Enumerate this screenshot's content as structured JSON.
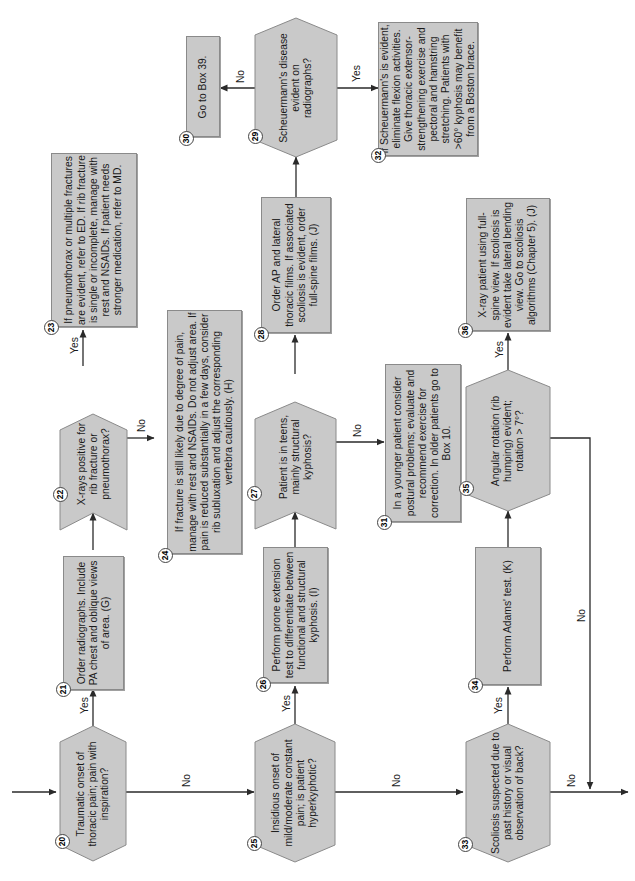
{
  "flowchart": {
    "orientation": "rotated-90-ccw",
    "colors": {
      "box_fill": "#c9c9c9",
      "box_border": "#8a8a8a",
      "line": "#333333"
    },
    "nodes": {
      "n20": {
        "number": "20",
        "type": "decision",
        "text": "Traumatic onset of thoracic pain; pain with inspiration?"
      },
      "n21": {
        "number": "21",
        "type": "process",
        "text": "Order radiographs. Include PA chest and oblique views of area. (G)"
      },
      "n22": {
        "number": "22",
        "type": "decision",
        "text": "X-rays positive for rib fracture or pneumothorax?"
      },
      "n23": {
        "number": "23",
        "type": "process",
        "text": "If pneumothorax or multiple fractures are evident, refer to ED. If rib fracture is single or incomplete, manage with rest and NSAIDs. If patient needs stronger medication, refer to MD."
      },
      "n24": {
        "number": "24",
        "type": "process",
        "text": "If fracture is still likely due to degree of pain, manage with rest and NSAIDs. Do not adjust area. If pain is reduced substantially in a few days, consider rib subluxation and adjust the corresponding vertebra cautiously. (H)"
      },
      "n25": {
        "number": "25",
        "type": "decision",
        "text": "Insidious onset of mild/moderate constant pain; is patient hyperkyphotic?"
      },
      "n26": {
        "number": "26",
        "type": "process",
        "text": "Perform prone extension test to differentiate between functional and structural kyphosis. (I)"
      },
      "n27": {
        "number": "27",
        "type": "decision",
        "text": "Patient is in teens, mainly structural kyphosis?"
      },
      "n28": {
        "number": "28",
        "type": "process",
        "text": "Order AP and lateral thoracic films. If associated scoliosis is evident, order full-spine films. (J)"
      },
      "n29": {
        "number": "29",
        "type": "decision",
        "text": "Scheuermann's disease evident on radiographs?"
      },
      "n30": {
        "number": "30",
        "type": "process",
        "text": "Go to Box 39."
      },
      "n31": {
        "number": "31",
        "type": "process",
        "text": "In a younger patient consider postural problems; evaluate and recommend exercise for correction. In older patients go to Box 10."
      },
      "n32": {
        "number": "32",
        "type": "process",
        "text": "If Scheuermann's is evident, eliminate flexion activities. Give thoracic extensor-strengthening exercise and pectoral and hamstring stretching. Patients with >60° kyphosis may benefit from a Boston brace."
      },
      "n33": {
        "number": "33",
        "type": "decision",
        "text": "Scoliosis suspected due to past history or visual observation of back?"
      },
      "n34": {
        "number": "34",
        "type": "process",
        "text": "Perform Adams' test. (K)"
      },
      "n35": {
        "number": "35",
        "type": "decision",
        "text": "Angular rotation (rib humping) evident; rotation > 7°?"
      },
      "n36": {
        "number": "36",
        "type": "process",
        "text": "X-ray patient using full-spine view. If scoliosis is evident take lateral bending view. Go to scoliosis algorithms (Chapter 5). (J)"
      }
    },
    "edge_labels": {
      "yes": "Yes",
      "no": "No"
    },
    "edges": [
      {
        "from": "20",
        "to": "21",
        "label": "Yes"
      },
      {
        "from": "20",
        "to": "25",
        "label": "No"
      },
      {
        "from": "21",
        "to": "22",
        "label": ""
      },
      {
        "from": "22",
        "to": "23",
        "label": "Yes"
      },
      {
        "from": "22",
        "to": "24",
        "label": "No"
      },
      {
        "from": "25",
        "to": "26",
        "label": "Yes"
      },
      {
        "from": "25",
        "to": "33",
        "label": "No"
      },
      {
        "from": "26",
        "to": "27",
        "label": ""
      },
      {
        "from": "27",
        "to": "28",
        "label": "Yes"
      },
      {
        "from": "27",
        "to": "31",
        "label": "No"
      },
      {
        "from": "28",
        "to": "29",
        "label": ""
      },
      {
        "from": "29",
        "to": "30",
        "label": "No"
      },
      {
        "from": "29",
        "to": "32",
        "label": "Yes"
      },
      {
        "from": "33",
        "to": "34",
        "label": "Yes"
      },
      {
        "from": "33",
        "to": "next",
        "label": "No"
      },
      {
        "from": "34",
        "to": "35",
        "label": ""
      },
      {
        "from": "35",
        "to": "36",
        "label": "Yes"
      },
      {
        "from": "35",
        "to": "next",
        "label": "No"
      }
    ]
  }
}
